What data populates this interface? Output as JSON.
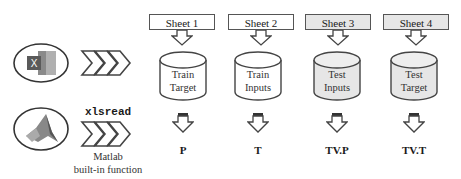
{
  "diagram": {
    "sources": [
      {
        "name": "excel",
        "icon": "excel-icon"
      },
      {
        "name": "matlab",
        "icon": "matlab-icon"
      }
    ],
    "function_label": "xlsread",
    "function_caption_line1": "Matlab",
    "function_caption_line2": "built-in function",
    "columns": [
      {
        "sheet": "Sheet 1",
        "line1": "Train",
        "line2": "Target",
        "variable": "P",
        "shade": "white"
      },
      {
        "sheet": "Sheet 2",
        "line1": "Train",
        "line2": "Inputs",
        "variable": "T",
        "shade": "white"
      },
      {
        "sheet": "Sheet 3",
        "line1": "Test",
        "line2": "Inputs",
        "variable": "TV.P",
        "shade": "gray"
      },
      {
        "sheet": "Sheet 4",
        "line1": "Test",
        "line2": "Target",
        "variable": "TV.T",
        "shade": "gray"
      }
    ],
    "colors": {
      "stroke": "#555555",
      "gray_fill": "#e6e6e6",
      "excel_green": "#6b6b6b",
      "matlab": "#777777"
    }
  }
}
